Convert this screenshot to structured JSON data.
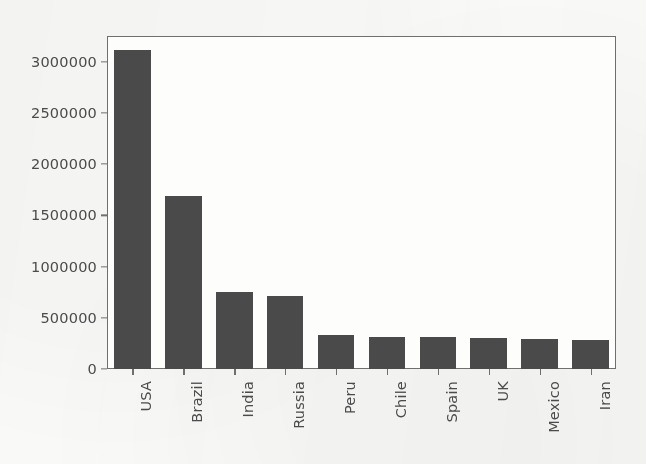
{
  "chart_data": {
    "type": "bar",
    "title": "",
    "subtitle": "",
    "xlabel": "",
    "ylabel": "",
    "categories": [
      "USA",
      "Brazil",
      "India",
      "Russia",
      "Peru",
      "Chile",
      "Spain",
      "UK",
      "Mexico",
      "Iran"
    ],
    "values": [
      3110000,
      1690000,
      755000,
      715000,
      330000,
      310000,
      310000,
      300000,
      290000,
      280000
    ],
    "ylim": [
      0,
      3250000
    ],
    "yticks": [
      0,
      500000,
      1000000,
      1500000,
      2000000,
      2500000,
      3000000
    ],
    "ytick_labels": [
      "0",
      "500000",
      "1000000",
      "1500000",
      "2000000",
      "2500000",
      "3000000"
    ],
    "grid": false,
    "legend": null,
    "legend_position": "none",
    "bar_color": "#4a4a4a",
    "axis_color": "#6f6f6f",
    "text_color": "#4b4b4b",
    "background_color": "#fbfbfa",
    "xtick_rotation": -90,
    "annotations": []
  }
}
